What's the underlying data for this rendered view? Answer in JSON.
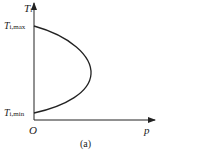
{
  "figure": {
    "caption": "(a)",
    "y_axis_label": "T",
    "y_axis_label_sub": "i",
    "x_axis_label": "p",
    "origin_label": "O",
    "tick_top_main": "T",
    "tick_top_sub": "i,max",
    "tick_bottom_main": "T",
    "tick_bottom_sub": "i,min",
    "stroke_color": "#222222"
  }
}
